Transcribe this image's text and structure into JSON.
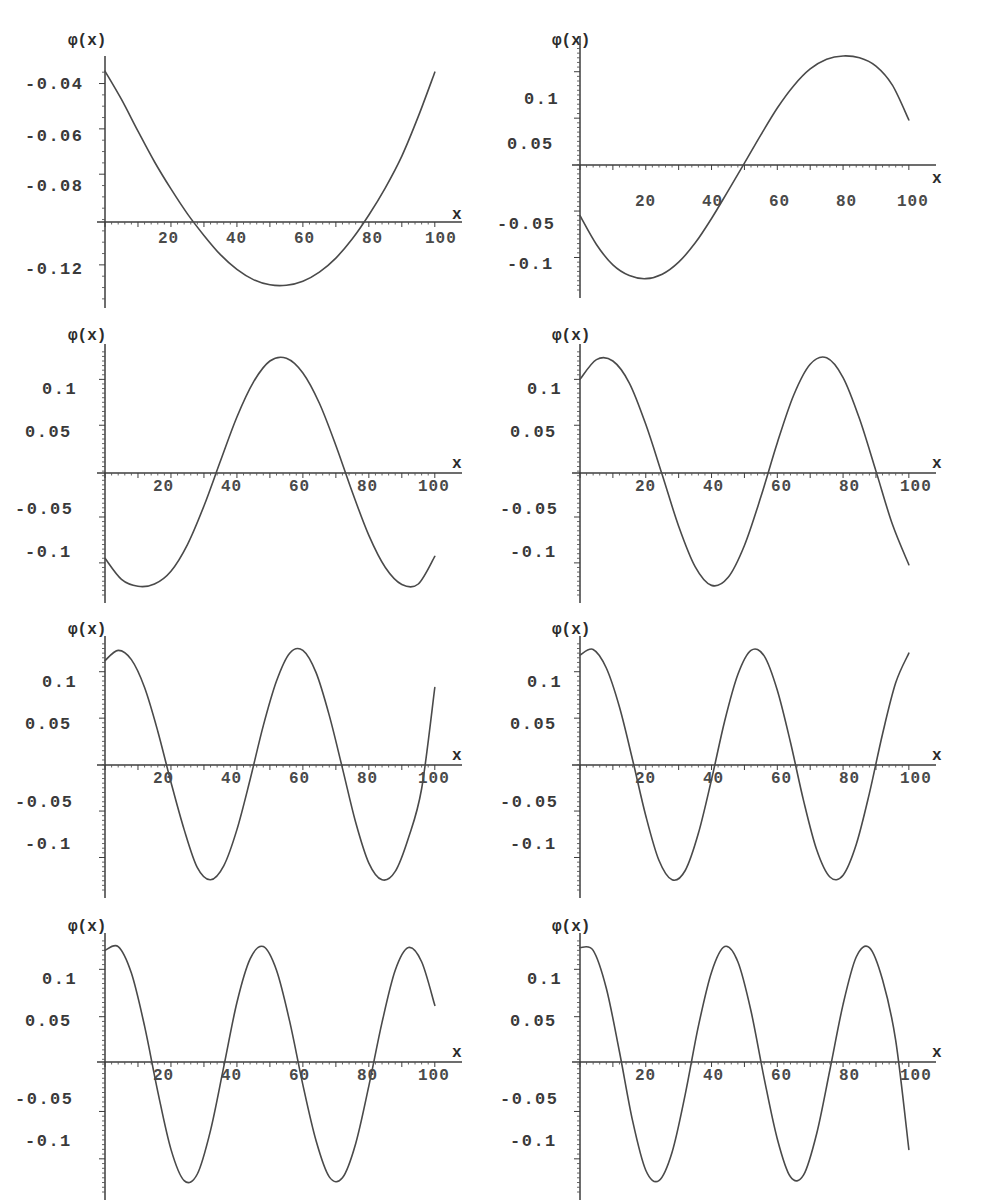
{
  "figure": {
    "axis_label_y": "φ(x)",
    "axis_label_x": "x",
    "background_color": "#ffffff",
    "curve_color": "#4a4a4a",
    "axis_color": "#3d3d3d",
    "panel_count": 8,
    "columns": 2,
    "rows": 4
  },
  "chart_data": [
    {
      "type": "line",
      "title": "",
      "xlabel": "x",
      "ylabel": "φ(x)",
      "xlim": [
        0,
        104
      ],
      "ylim": [
        -0.132,
        -0.032
      ],
      "xticks": [
        20,
        40,
        60,
        80,
        100
      ],
      "xticklabels": [
        "20",
        "40",
        "60",
        "80",
        "100"
      ],
      "yticks": [
        -0.04,
        -0.06,
        -0.08,
        -0.12
      ],
      "yticklabels": [
        "-0.04",
        "-0.06",
        "-0.08",
        "-0.12"
      ],
      "grid": false,
      "legend": false,
      "mode_index": 0,
      "description": "Single negative arch; starts near -0.034, minimum about -0.129 at x=52, rising back to -0.035 at x=100",
      "x": [
        0,
        5,
        10,
        15,
        20,
        25,
        30,
        35,
        40,
        45,
        50,
        55,
        60,
        65,
        70,
        75,
        80,
        85,
        90,
        95,
        100
      ],
      "y": [
        -0.0345,
        -0.047,
        -0.061,
        -0.0745,
        -0.0865,
        -0.0975,
        -0.107,
        -0.1155,
        -0.122,
        -0.1265,
        -0.1288,
        -0.129,
        -0.1272,
        -0.1232,
        -0.117,
        -0.1085,
        -0.098,
        -0.086,
        -0.072,
        -0.0545,
        -0.035
      ]
    },
    {
      "type": "line",
      "title": "",
      "xlabel": "x",
      "ylabel": "φ(x)",
      "xlim": [
        0,
        104
      ],
      "ylim": [
        -0.13,
        0.13
      ],
      "xticks": [
        20,
        40,
        60,
        80,
        100
      ],
      "xticklabels": [
        "20",
        "40",
        "60",
        "80",
        "100"
      ],
      "yticks": [
        0.1,
        0.05,
        -0.05,
        -0.1
      ],
      "yticklabels": [
        "0.1",
        "0.05",
        "-0.05",
        "-0.1"
      ],
      "grid": false,
      "legend": false,
      "mode_index": 1,
      "description": "Half-period sine; starts -0.055, minimum -0.123 near x=21, zero crossing x=51, maximum 0.117 near x=81, ends 0.048",
      "x": [
        0,
        5,
        10,
        15,
        20,
        25,
        30,
        35,
        40,
        45,
        50,
        55,
        60,
        65,
        70,
        75,
        80,
        85,
        90,
        95,
        100
      ],
      "y": [
        -0.055,
        -0.086,
        -0.108,
        -0.1195,
        -0.1228,
        -0.118,
        -0.105,
        -0.0845,
        -0.058,
        -0.0285,
        0.0015,
        0.032,
        0.061,
        0.085,
        0.103,
        0.1135,
        0.117,
        0.115,
        0.106,
        0.0855,
        0.048
      ]
    },
    {
      "type": "line",
      "title": "",
      "xlabel": "x",
      "ylabel": "φ(x)",
      "xlim": [
        0,
        104
      ],
      "ylim": [
        -0.13,
        0.13
      ],
      "xticks": [
        20,
        40,
        60,
        80,
        100
      ],
      "xticklabels": [
        "20",
        "40",
        "60",
        "80",
        "100"
      ],
      "yticks": [
        0.1,
        0.05,
        -0.05,
        -0.1
      ],
      "yticklabels": [
        "0.1",
        "0.05",
        "-0.05",
        "-0.1"
      ],
      "grid": false,
      "legend": false,
      "mode_index": 2,
      "description": "1.5 periods; starts -0.095, trough -0.125 at x=13, zero x=32, peak 0.122 at x=52, zero x=72, trough -0.125 at x=92, ends -0.093",
      "x": [
        0,
        5,
        10,
        15,
        20,
        25,
        30,
        35,
        40,
        45,
        50,
        55,
        60,
        65,
        70,
        75,
        80,
        85,
        90,
        95,
        100
      ],
      "y": [
        -0.095,
        -0.118,
        -0.1255,
        -0.123,
        -0.109,
        -0.08,
        -0.038,
        0.011,
        0.059,
        0.097,
        0.12,
        0.123,
        0.107,
        0.074,
        0.028,
        -0.023,
        -0.07,
        -0.105,
        -0.1235,
        -0.123,
        -0.093
      ]
    },
    {
      "type": "line",
      "title": "",
      "xlabel": "x",
      "ylabel": "φ(x)",
      "xlim": [
        0,
        104
      ],
      "ylim": [
        -0.13,
        0.13
      ],
      "xticks": [
        20,
        40,
        60,
        80,
        100
      ],
      "xticklabels": [
        "20",
        "40",
        "60",
        "80",
        "100"
      ],
      "yticks": [
        0.1,
        0.05,
        -0.05,
        -0.1
      ],
      "yticklabels": [
        "0.1",
        "0.05",
        "-0.05",
        "-0.1"
      ],
      "grid": false,
      "legend": false,
      "mode_index": 3,
      "description": "2 periods; starts 0.100, peak 0.123 at x=8, zero x=22, trough -0.126 at x=37, zero x=51, peak at x=65, zero x=80, trough at x=95, ends -0.102",
      "x": [
        0,
        5,
        10,
        15,
        20,
        25,
        30,
        35,
        40,
        45,
        50,
        55,
        60,
        65,
        70,
        75,
        80,
        85,
        90,
        95,
        100
      ],
      "y": [
        0.1,
        0.1215,
        0.12,
        0.096,
        0.051,
        -0.004,
        -0.06,
        -0.104,
        -0.1245,
        -0.116,
        -0.081,
        -0.028,
        0.031,
        0.083,
        0.1165,
        0.1235,
        0.102,
        0.057,
        0.0,
        -0.058,
        -0.102
      ]
    },
    {
      "type": "line",
      "title": "",
      "xlabel": "x",
      "ylabel": "φ(x)",
      "xlim": [
        0,
        104
      ],
      "ylim": [
        -0.13,
        0.13
      ],
      "xticks": [
        20,
        40,
        60,
        80,
        100
      ],
      "xticklabels": [
        "20",
        "40",
        "60",
        "80",
        "100"
      ],
      "yticks": [
        0.1,
        0.05,
        -0.05,
        -0.1
      ],
      "yticklabels": [
        "0.1",
        "0.05",
        "-0.05",
        "-0.1"
      ],
      "grid": false,
      "legend": false,
      "mode_index": 4,
      "description": "2.5 periods; starts 0.112, peak at x=6, zero x=18, trough x=30, zero x=40, peak x=52, zero x=62, trough x=75, zero x=85, peak x=97",
      "x": [
        0,
        4,
        8,
        12,
        16,
        20,
        24,
        28,
        32,
        36,
        40,
        44,
        48,
        52,
        56,
        60,
        64,
        68,
        72,
        76,
        80,
        84,
        88,
        92,
        96,
        100
      ],
      "y": [
        0.112,
        0.123,
        0.113,
        0.083,
        0.036,
        -0.019,
        -0.07,
        -0.111,
        -0.124,
        -0.109,
        -0.07,
        -0.016,
        0.042,
        0.09,
        0.12,
        0.123,
        0.099,
        0.053,
        -0.004,
        -0.062,
        -0.106,
        -0.124,
        -0.115,
        -0.079,
        -0.026,
        0.083
      ]
    },
    {
      "type": "line",
      "title": "",
      "xlabel": "x",
      "ylabel": "φ(x)",
      "xlim": [
        0,
        104
      ],
      "ylim": [
        -0.13,
        0.13
      ],
      "xticks": [
        20,
        40,
        60,
        80,
        100
      ],
      "xticklabels": [
        "20",
        "40",
        "60",
        "80",
        "100"
      ],
      "yticks": [
        0.1,
        0.05,
        -0.05,
        -0.1
      ],
      "yticklabels": [
        "0.1",
        "0.05",
        "-0.05",
        "-0.1"
      ],
      "grid": false,
      "legend": false,
      "mode_index": 5,
      "description": "3 periods; peaks near x=5, 40, 78 and troughs near x=22, 58, 95; amplitude about 0.124",
      "x": [
        0,
        4,
        8,
        12,
        16,
        20,
        24,
        28,
        32,
        36,
        40,
        44,
        48,
        52,
        56,
        60,
        64,
        68,
        72,
        76,
        80,
        84,
        88,
        92,
        96,
        100
      ],
      "y": [
        0.118,
        0.124,
        0.104,
        0.062,
        0.005,
        -0.055,
        -0.103,
        -0.124,
        -0.114,
        -0.074,
        -0.016,
        0.047,
        0.097,
        0.123,
        0.117,
        0.08,
        0.024,
        -0.039,
        -0.092,
        -0.121,
        -0.119,
        -0.086,
        -0.031,
        0.033,
        0.088,
        0.12
      ]
    },
    {
      "type": "line",
      "title": "",
      "xlabel": "x",
      "ylabel": "φ(x)",
      "xlim": [
        0,
        104
      ],
      "ylim": [
        -0.13,
        0.13
      ],
      "xticks": [
        20,
        40,
        60,
        80,
        100
      ],
      "xticklabels": [
        "20",
        "40",
        "60",
        "80",
        "100"
      ],
      "yticks": [
        0.1,
        0.05,
        -0.05,
        -0.1
      ],
      "yticklabels": [
        "0.1",
        "0.05",
        "-0.05",
        "-0.1"
      ],
      "grid": false,
      "legend": false,
      "mode_index": 6,
      "description": "3.5 periods; peaks near x=4, 33, 62, 91 and troughs near x=18, 47, 76; amplitude about 0.124",
      "x": [
        0,
        4,
        8,
        12,
        16,
        20,
        24,
        28,
        32,
        36,
        40,
        44,
        48,
        52,
        56,
        60,
        64,
        68,
        72,
        76,
        80,
        84,
        88,
        92,
        96,
        100
      ],
      "y": [
        0.12,
        0.124,
        0.096,
        0.04,
        -0.029,
        -0.09,
        -0.123,
        -0.116,
        -0.07,
        -0.003,
        0.065,
        0.111,
        0.124,
        0.099,
        0.045,
        -0.022,
        -0.081,
        -0.119,
        -0.12,
        -0.084,
        -0.023,
        0.044,
        0.099,
        0.123,
        0.108,
        0.062
      ]
    },
    {
      "type": "line",
      "title": "",
      "xlabel": "x",
      "ylabel": "φ(x)",
      "xlim": [
        0,
        104
      ],
      "ylim": [
        -0.13,
        0.13
      ],
      "xticks": [
        20,
        40,
        60,
        80,
        100
      ],
      "xticklabels": [
        "20",
        "40",
        "60",
        "80",
        "100"
      ],
      "yticks": [
        0.1,
        0.05,
        -0.05,
        -0.1
      ],
      "yticklabels": [
        "0.1",
        "0.05",
        "-0.05",
        "-0.1"
      ],
      "grid": false,
      "legend": false,
      "mode_index": 7,
      "description": "4 periods; peaks near x=3, 28, 53, 78 and troughs near x=16, 41, 66, 91; amplitude about 0.125",
      "x": [
        0,
        4,
        8,
        12,
        16,
        20,
        24,
        28,
        32,
        36,
        40,
        44,
        48,
        52,
        56,
        60,
        64,
        68,
        72,
        76,
        80,
        84,
        88,
        92,
        96,
        100
      ],
      "y": [
        0.123,
        0.12,
        0.08,
        0.013,
        -0.06,
        -0.112,
        -0.123,
        -0.093,
        -0.032,
        0.04,
        0.097,
        0.124,
        0.108,
        0.056,
        -0.015,
        -0.079,
        -0.119,
        -0.117,
        -0.073,
        -0.006,
        0.063,
        0.113,
        0.123,
        0.089,
        0.025,
        -0.09
      ]
    }
  ]
}
